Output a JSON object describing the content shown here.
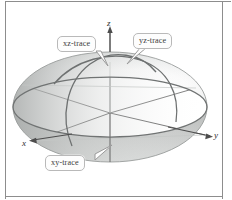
{
  "figure": {
    "background_color": "#ffffff",
    "frame_color": "#8d8d8d"
  },
  "axes": {
    "x": {
      "label": "x",
      "direction": "down-left",
      "arrow": true
    },
    "y": {
      "label": "y",
      "direction": "right",
      "arrow": true
    },
    "z": {
      "label": "z",
      "direction": "up",
      "arrow": true
    },
    "origin_px": [
      110,
      113
    ]
  },
  "callouts": [
    {
      "id": "xz",
      "label": "xz-trace",
      "italic_prefix": "xz",
      "suffix": "-trace",
      "tail": "down-right"
    },
    {
      "id": "yz",
      "label": "yz-trace",
      "italic_prefix": "yz",
      "suffix": "-trace",
      "tail": "down-left"
    },
    {
      "id": "xy",
      "label": "xy-trace",
      "italic_prefix": "xy",
      "suffix": "-trace",
      "tail": "up-right"
    }
  ],
  "surface": {
    "shape": "ellipsoid",
    "center_px": [
      110,
      107
    ],
    "radius_x_px": 97,
    "radius_y_px": 55,
    "fill_light": "#ffffff",
    "fill_mid": "#d9dbda",
    "fill_dark": "#a9acab",
    "outline_color": "#949796"
  },
  "traces": {
    "xy": {
      "color": "#707373",
      "description": "horizontal equatorial ellipse"
    },
    "xz": {
      "color": "#6e7171",
      "description": "arc in the xz-plane"
    },
    "yz": {
      "color": "#6e7171",
      "description": "arc in the yz-plane"
    }
  }
}
